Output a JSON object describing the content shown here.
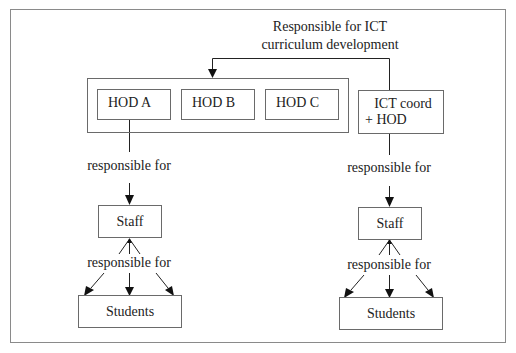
{
  "diagram": {
    "type": "organizational-responsibility-flow",
    "top_label": {
      "line1": "Responsible for ICT",
      "line2": "curriculum development"
    },
    "hod_group": {
      "boxes": [
        {
          "label": "HOD A"
        },
        {
          "label": "HOD B"
        },
        {
          "label": "HOD C"
        }
      ]
    },
    "ict_box": {
      "line1": "ICT coord",
      "line2": "+ HOD"
    },
    "left_column": {
      "relation_1": "responsible for",
      "staff": "Staff",
      "relation_2": "responsible for",
      "students": "Students"
    },
    "right_column": {
      "relation_1": "responsible for",
      "staff": "Staff",
      "relation_2": "responsible for",
      "students": "Students"
    },
    "edges": [
      {
        "from": "ICT coord + HOD",
        "to": "HOD group",
        "label": "Responsible for ICT curriculum development"
      },
      {
        "from": "HOD A",
        "to": "Staff (left)",
        "label": "responsible for"
      },
      {
        "from": "Staff (left)",
        "to": "Students (left)",
        "label": "responsible for",
        "arrows": 3
      },
      {
        "from": "ICT coord + HOD",
        "to": "Staff (right)",
        "label": "responsible for"
      },
      {
        "from": "Staff (right)",
        "to": "Students (right)",
        "label": "responsible for",
        "arrows": 3
      }
    ],
    "colors": {
      "line": "#222222",
      "box_border": "#6a6a6a",
      "frame_border": "#8a8a8a",
      "background": "#ffffff"
    }
  }
}
